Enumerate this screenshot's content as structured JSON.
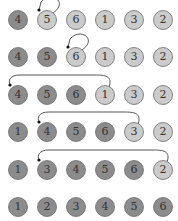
{
  "colors": {
    "sorted": "#8c8c8c",
    "unsorted": "#cbcbcb",
    "stroke": "#6a6a6a",
    "arrow": "#555555"
  },
  "rows": [
    {
      "values": [
        "4",
        "5",
        "6",
        "1",
        "3",
        "2"
      ],
      "sorted_count": 1,
      "arrow": {
        "from": 1,
        "to": 1
      }
    },
    {
      "values": [
        "4",
        "5",
        "6",
        "1",
        "3",
        "2"
      ],
      "sorted_count": 2,
      "arrow": {
        "from": 2,
        "to": 2
      }
    },
    {
      "values": [
        "4",
        "5",
        "6",
        "1",
        "3",
        "2"
      ],
      "sorted_count": 3,
      "arrow": {
        "from": 3,
        "to": 0
      }
    },
    {
      "values": [
        "1",
        "4",
        "5",
        "6",
        "3",
        "2"
      ],
      "sorted_count": 4,
      "arrow": {
        "from": 4,
        "to": 1
      }
    },
    {
      "values": [
        "1",
        "3",
        "4",
        "5",
        "6",
        "2"
      ],
      "sorted_count": 5,
      "arrow": {
        "from": 5,
        "to": 1
      }
    },
    {
      "values": [
        "1",
        "2",
        "3",
        "4",
        "5",
        "6"
      ],
      "sorted_count": 6,
      "arrow": null
    }
  ]
}
